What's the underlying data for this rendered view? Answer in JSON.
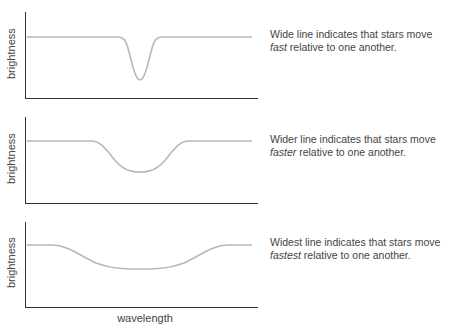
{
  "panels": [
    {
      "ylabel": "brightness",
      "caption_pre": "Wide line indicates that stars move ",
      "caption_em": "fast",
      "caption_post": " relative to one another.",
      "line_width_desc": "narrow dip"
    },
    {
      "ylabel": "brightness",
      "caption_pre": "Wider line indicates that stars move ",
      "caption_em": "faster",
      "caption_post": " relative to one another.",
      "line_width_desc": "medium dip"
    },
    {
      "ylabel": "brightness",
      "caption_pre": "Widest line indicates that stars move ",
      "caption_em": "fastest",
      "caption_post": " relative to one another.",
      "line_width_desc": "broad dip"
    }
  ],
  "xlabel": "wavelength",
  "colors": {
    "axis": "#333333",
    "curve": "#b8b8b8",
    "text": "#444444"
  }
}
